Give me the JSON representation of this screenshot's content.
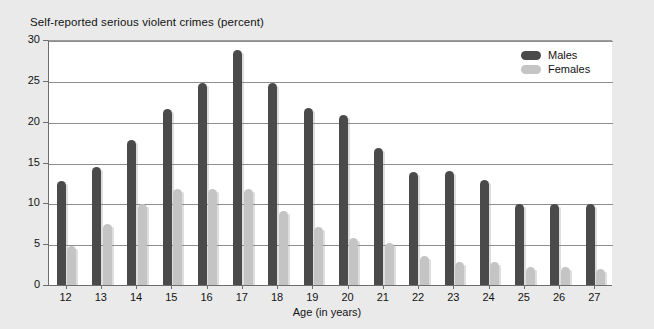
{
  "chart_data": {
    "type": "bar",
    "title": "Self-reported serious violent crimes (percent)",
    "xlabel": "Age (in years)",
    "ylabel": "",
    "categories": [
      "12",
      "13",
      "14",
      "15",
      "16",
      "17",
      "18",
      "19",
      "20",
      "21",
      "22",
      "23",
      "24",
      "25",
      "26",
      "27"
    ],
    "series": [
      {
        "name": "Males",
        "color": "#4a4a4a",
        "values": [
          12.7,
          14.5,
          17.7,
          21.6,
          24.7,
          28.8,
          24.7,
          21.7,
          20.8,
          16.8,
          13.8,
          13.9,
          12.8,
          9.9,
          9.9,
          9.9
        ]
      },
      {
        "name": "Females",
        "color": "#c4c4c4",
        "values": [
          4.8,
          7.5,
          9.9,
          11.7,
          11.7,
          11.8,
          9.1,
          7.1,
          5.8,
          5.1,
          3.5,
          2.8,
          2.8,
          2.2,
          2.2,
          2.0
        ]
      }
    ],
    "ylim": [
      0,
      30
    ],
    "yticks": [
      0,
      5,
      10,
      15,
      20,
      25,
      30
    ],
    "ytick_labels": [
      "0",
      "5",
      "10",
      "15",
      "20",
      "25",
      "30"
    ],
    "grid": true,
    "legend_position": "top-right",
    "background_color": "#eaeaea",
    "plot_background_color": "#ffffff",
    "gridline_color": "#8e8e8e",
    "axis_color": "#6d6d6d"
  },
  "legend": {
    "items": [
      {
        "label": "Males"
      },
      {
        "label": "Females"
      }
    ]
  }
}
